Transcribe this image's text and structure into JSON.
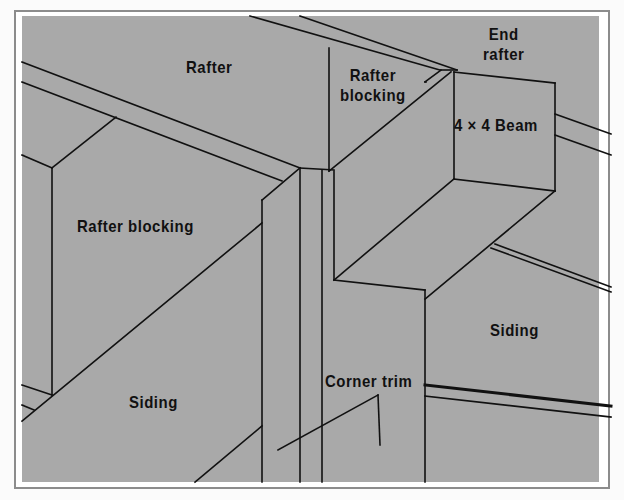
{
  "diagram": {
    "colors": {
      "panel_fill": "#a9a9a9",
      "line": "#111111",
      "frame_border": "#8c8c8c",
      "page_bg": "#fbfbfb"
    },
    "labels": {
      "rafter": "Rafter",
      "rafter_blocking_top_line1": "Rafter",
      "rafter_blocking_top_line2": "blocking",
      "end_rafter_line1": "End",
      "end_rafter_line2": "rafter",
      "beam": "4 × 4 Beam",
      "rafter_blocking_left": "Rafter blocking",
      "siding_right": "Siding",
      "siding_left": "Siding",
      "corner_trim": "Corner trim"
    }
  }
}
